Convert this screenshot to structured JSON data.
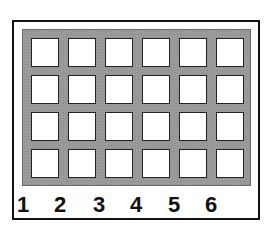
{
  "diagram": {
    "rows": 4,
    "columns": 6,
    "column_labels": [
      "1",
      "2",
      "3",
      "4",
      "5",
      "6"
    ],
    "colors": {
      "frame": "#111111",
      "grid_background": "#9a9a9a",
      "cell": "#ffffff",
      "cell_border": "#222222"
    }
  }
}
